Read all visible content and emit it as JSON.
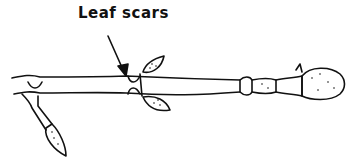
{
  "diagram": {
    "label": "Leaf scars",
    "colors": {
      "ink": "#111111",
      "background": "#ffffff"
    }
  }
}
